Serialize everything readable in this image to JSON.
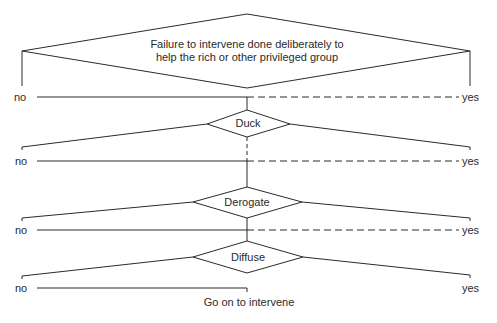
{
  "diagram": {
    "title_node": {
      "line1": "Failure to intervene done deliberately to",
      "line2": "help the rich or other privileged group"
    },
    "decisions": [
      {
        "label": "Duck"
      },
      {
        "label": "Derogate"
      },
      {
        "label": "Diffuse"
      }
    ],
    "branches": [
      {
        "no": "no",
        "yes": "yes"
      },
      {
        "no": "no",
        "yes": "yes"
      },
      {
        "no": "no",
        "yes": "yes"
      },
      {
        "no": "no",
        "yes": "yes"
      }
    ],
    "outcome": "Go on to intervene",
    "colors": {
      "line": "#2a2a2a",
      "background": "#ffffff"
    }
  }
}
